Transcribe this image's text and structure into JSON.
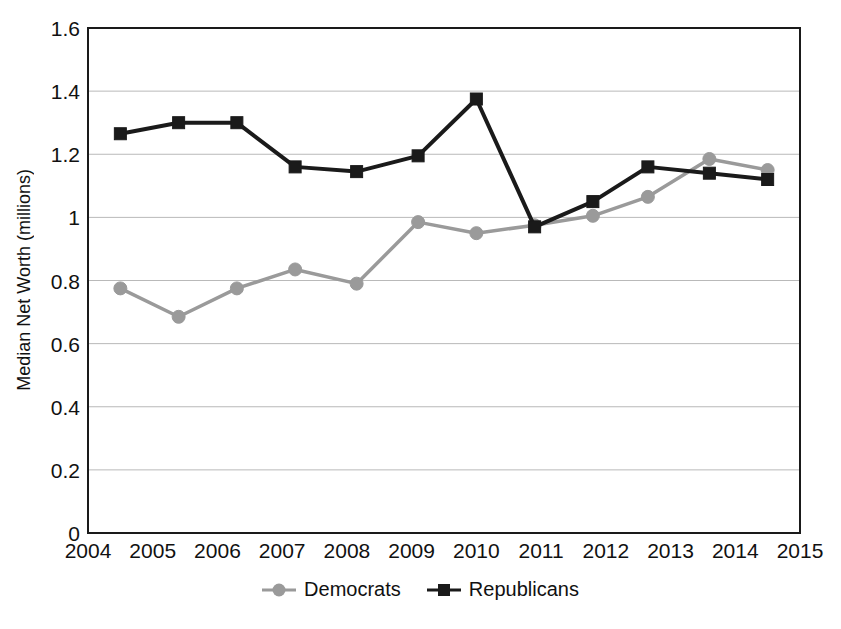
{
  "chart_data": {
    "type": "line",
    "title": "",
    "xlabel": "",
    "ylabel": "Median Net Worth (millions)",
    "xlim": [
      2004,
      2015
    ],
    "ylim": [
      0,
      1.6
    ],
    "grid": true,
    "legend_position": "bottom",
    "xticks": [
      "2004",
      "2005",
      "2006",
      "2007",
      "2008",
      "2009",
      "2010",
      "2011",
      "2012",
      "2013",
      "2014",
      "2015"
    ],
    "yticks": [
      "0",
      "0.2",
      "0.4",
      "0.6",
      "0.8",
      "1",
      "1.2",
      "1.4",
      "1.6"
    ],
    "x": [
      2004.5,
      2005.4,
      2006.3,
      2007.2,
      2008.15,
      2009.1,
      2010.0,
      2010.9,
      2011.8,
      2012.65,
      2013.6,
      2014.5
    ],
    "series": [
      {
        "name": "Democrats",
        "color": "#9a9a9a",
        "marker": "circle",
        "values": [
          0.775,
          0.685,
          0.775,
          0.835,
          0.79,
          0.985,
          0.95,
          0.975,
          1.005,
          1.065,
          1.185,
          1.15
        ]
      },
      {
        "name": "Republicans",
        "color": "#1a1a1a",
        "marker": "square",
        "values": [
          1.265,
          1.3,
          1.3,
          1.16,
          1.145,
          1.195,
          1.375,
          0.97,
          1.05,
          1.16,
          1.14,
          1.12
        ]
      }
    ]
  },
  "axis": {
    "ylabel": "Median Net Worth (millions)"
  },
  "legend": {
    "items": [
      {
        "label": "Democrats"
      },
      {
        "label": "Republicans"
      }
    ]
  },
  "colors": {
    "democrats": "#9a9a9a",
    "republicans": "#1a1a1a",
    "grid": "#b9b9b9",
    "frame": "#1a1a1a"
  }
}
